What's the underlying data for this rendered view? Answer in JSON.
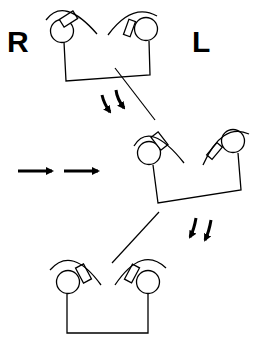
{
  "labels": {
    "right": "R",
    "left": "L"
  },
  "colors": {
    "stroke": "#000000",
    "background": "#ffffff"
  },
  "figures": [
    {
      "name": "top-figure",
      "description": "two eyes tilted upward-outward, bracket base"
    },
    {
      "name": "middle-figure",
      "description": "figure rotated/shifted right"
    },
    {
      "name": "bottom-figure",
      "description": "two eyes tilted inward, level bracket base"
    }
  ],
  "arrows": {
    "horizontal": "double right arrows",
    "downward_top": "double curved down arrows",
    "downward_middle": "double curved down arrows"
  }
}
